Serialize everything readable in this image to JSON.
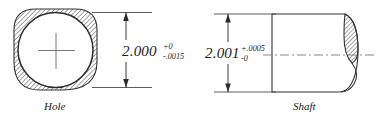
{
  "drawing": {
    "title": "Hole and Shaft Fit Tolerance Drawing",
    "background_color": "#ffffff",
    "line_color": "#333333",
    "text_color": "#1a1a1a",
    "hatch_color": "#555555"
  },
  "hole": {
    "label": "Hole",
    "dimension": {
      "nominal": "2.000",
      "upper_tolerance": "+0",
      "lower_tolerance": "-.0015"
    },
    "feature_icons": {
      "center_mark": "center-cross-icon",
      "section_hatch": "section-hatch-icon",
      "dimension_arrows": "arrow-up-down-icon"
    }
  },
  "shaft": {
    "label": "Shaft",
    "dimension": {
      "nominal": "2.001",
      "upper_tolerance": "+.0005",
      "lower_tolerance": "-0"
    },
    "feature_icons": {
      "axis_centerline": "centerline-icon",
      "broken_section": "broken-out-section-icon",
      "dimension_arrows": "arrow-up-down-icon"
    }
  }
}
